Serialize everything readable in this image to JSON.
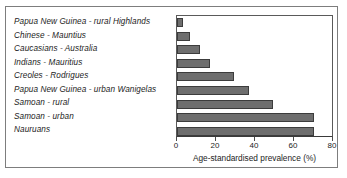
{
  "chart_data": {
    "type": "bar",
    "orientation": "horizontal",
    "title": "",
    "subtitle": "",
    "xlabel": "Age-standardised prevalence (%)",
    "ylabel": "",
    "xlim": [
      0,
      80
    ],
    "xticks": [
      0,
      20,
      40,
      60,
      80
    ],
    "xtick_labels": [
      "0",
      "20",
      "40",
      "60",
      "80"
    ],
    "grid": false,
    "legend": null,
    "legend_position": "none",
    "bar_color": "#6e6e6e",
    "bar_edge_color": "#3c3c3c",
    "categories": [
      "Papua New Guinea - rural Highlands",
      "Chinese - Mauntius",
      "Caucasians - Australia",
      "Indians - Mauritius",
      "Creoles - Rodrigues",
      "Papua New Guinea - urban Wanigelas",
      "Samoan - rural",
      "Samoan - urban",
      "Nauruans"
    ],
    "values": [
      3,
      6.5,
      12,
      17,
      29,
      37,
      49,
      70,
      70.5
    ]
  }
}
